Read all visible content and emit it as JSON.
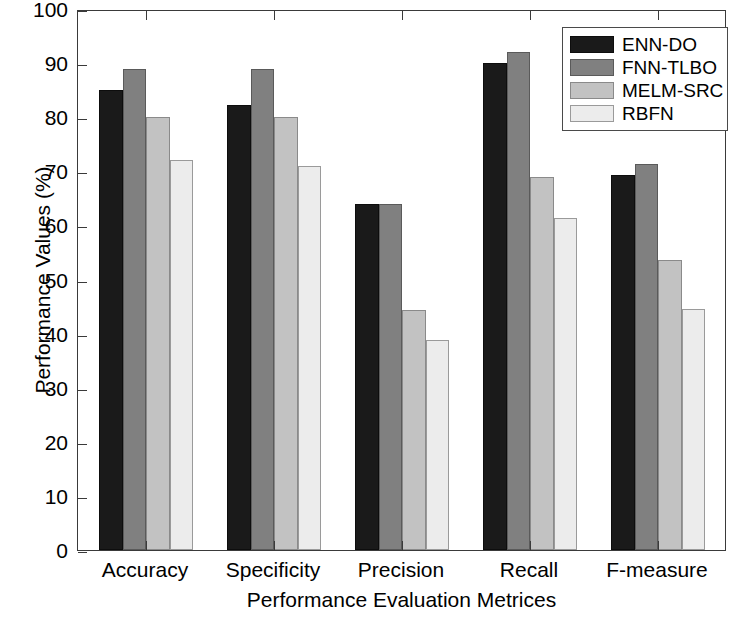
{
  "chart_data": {
    "type": "bar",
    "title": "",
    "xlabel": "Performance Evaluation Metrices",
    "ylabel": "Performance Values (%)",
    "categories": [
      "Accuracy",
      "Specificity",
      "Precision",
      "Recall",
      "F-measure"
    ],
    "series": [
      {
        "name": "ENN-DO",
        "color": "#1a1a1a",
        "values": [
          85.0,
          82.2,
          64.0,
          90.1,
          69.4
        ]
      },
      {
        "name": "FNN-TLBO",
        "color": "#808080",
        "values": [
          89.0,
          89.0,
          64.0,
          92.0,
          71.3
        ]
      },
      {
        "name": "MELM-SRC",
        "color": "#c2c2c2",
        "values": [
          80.0,
          80.1,
          44.4,
          69.0,
          53.6
        ]
      },
      {
        "name": "RBFN",
        "color": "#ececec",
        "values": [
          72.1,
          71.0,
          38.9,
          61.3,
          44.5
        ]
      }
    ],
    "ylim": [
      0,
      100
    ],
    "yticks": [
      0,
      10,
      20,
      30,
      40,
      50,
      60,
      70,
      80,
      90,
      100
    ],
    "ytick_labels": [
      "0",
      "10",
      "20",
      "30",
      "40",
      "50",
      "60",
      "70",
      "80",
      "90",
      "100"
    ],
    "grid": false,
    "legend_position": "top-right",
    "legend_entries": [
      "ENN-DO",
      "FNN-TLBO",
      "MELM-SRC",
      "RBFN"
    ]
  }
}
